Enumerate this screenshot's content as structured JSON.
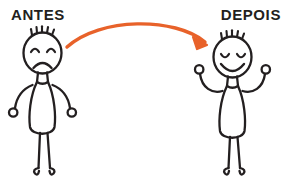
{
  "scene": {
    "title_left": "ANTES",
    "title_right": "DEPOIS",
    "background_color": "#ffffff",
    "ink_color": "#231f20",
    "accent_color": "#e8622a",
    "width": 292,
    "height": 189
  },
  "figures": [
    {
      "id": "before",
      "label": "ANTES",
      "mood": "sad",
      "expression": {
        "eyes": "arched-downward",
        "mouth": "frown",
        "hair_spikes": 5
      },
      "arms": "drooping-down",
      "hands": "open-circles",
      "feet": "curled-loops",
      "stroke_color": "#231f20"
    },
    {
      "id": "after",
      "label": "DEPOIS",
      "mood": "happy",
      "expression": {
        "eyes": "closed-curved",
        "mouth": "smile",
        "hair_spikes": 5
      },
      "arms": "raised-up",
      "hands": "open-circles",
      "feet": "curled-loops",
      "stroke_color": "#231f20"
    }
  ],
  "arrow": {
    "name": "transition-arrow",
    "color": "#e8622a",
    "direction": "left-to-right",
    "shape": "curved-arc",
    "head": "pointing-down-right",
    "stroke_width": 3.4
  }
}
